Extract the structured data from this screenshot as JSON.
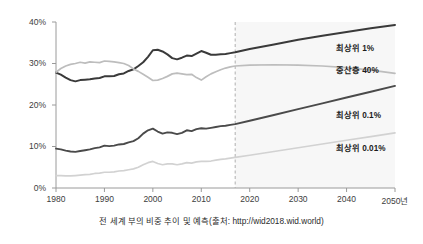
{
  "chart_data": {
    "type": "line",
    "title": "",
    "caption": "전 세계 부의 비중 추이 및 예측(출처: http://wid2018.wid.world)",
    "xlabel": "",
    "ylabel": "",
    "xlim": [
      1980,
      2050
    ],
    "ylim": [
      0,
      40
    ],
    "grid": false,
    "legend_position": "right-inline",
    "forecast_start": 2017,
    "forecast_divider_label": "",
    "y_ticks": [
      0,
      10,
      20,
      30,
      40
    ],
    "y_tick_labels": [
      "0%",
      "10%",
      "20%",
      "30%",
      "40%"
    ],
    "x_ticks": [
      1980,
      1990,
      2000,
      2010,
      2020,
      2030,
      2040,
      2050
    ],
    "x_tick_labels": [
      "1980",
      "1990",
      "2000",
      "2010",
      "2020",
      "2030",
      "2040",
      "2050년"
    ],
    "series": [
      {
        "name": "최상위 1%",
        "label": "최상위 1%",
        "color": "#3a3a3a",
        "width": 2.0,
        "x": [
          1980,
          1981,
          1982,
          1983,
          1984,
          1985,
          1986,
          1987,
          1988,
          1989,
          1990,
          1991,
          1992,
          1993,
          1994,
          1995,
          1996,
          1997,
          1998,
          1999,
          2000,
          2001,
          2002,
          2003,
          2004,
          2005,
          2006,
          2007,
          2008,
          2009,
          2010,
          2011,
          2012,
          2013,
          2014,
          2015,
          2016,
          2017,
          2020,
          2025,
          2030,
          2035,
          2040,
          2045,
          2050
        ],
        "values": [
          27.8,
          27.3,
          26.6,
          26.0,
          25.7,
          26.0,
          26.1,
          26.2,
          26.4,
          26.5,
          26.9,
          26.9,
          27.0,
          27.4,
          27.6,
          28.2,
          28.6,
          29.4,
          30.3,
          31.6,
          33.2,
          33.3,
          32.9,
          32.2,
          31.3,
          31.0,
          31.4,
          31.9,
          31.8,
          32.4,
          33.0,
          32.6,
          32.1,
          32.1,
          32.2,
          32.3,
          32.5,
          32.7,
          33.5,
          34.6,
          35.7,
          36.7,
          37.6,
          38.5,
          39.3
        ]
      },
      {
        "name": "중산층 40%",
        "label": "중산층 40%",
        "color": "#bdbdbd",
        "width": 1.7,
        "x": [
          1980,
          1981,
          1982,
          1983,
          1984,
          1985,
          1986,
          1987,
          1988,
          1989,
          1990,
          1991,
          1992,
          1993,
          1994,
          1995,
          1996,
          1997,
          1998,
          1999,
          2000,
          2001,
          2002,
          2003,
          2004,
          2005,
          2006,
          2007,
          2008,
          2009,
          2010,
          2011,
          2012,
          2013,
          2014,
          2015,
          2016,
          2017,
          2020,
          2025,
          2030,
          2035,
          2040,
          2045,
          2050
        ],
        "values": [
          27.9,
          28.8,
          29.4,
          29.8,
          30.0,
          30.3,
          30.1,
          30.4,
          30.3,
          30.2,
          30.6,
          30.5,
          30.4,
          30.2,
          30.0,
          29.5,
          28.7,
          28.1,
          27.4,
          26.7,
          25.9,
          26.0,
          26.4,
          26.9,
          27.5,
          27.7,
          27.5,
          27.3,
          27.4,
          26.6,
          26.0,
          26.8,
          27.5,
          28.0,
          28.5,
          28.9,
          29.2,
          29.4,
          29.6,
          29.7,
          29.6,
          29.4,
          29.0,
          28.4,
          27.6
        ]
      },
      {
        "name": "최상위 0.1%",
        "label": "최상위 0.1%",
        "color": "#4a4a4a",
        "width": 1.9,
        "x": [
          1980,
          1981,
          1982,
          1983,
          1984,
          1985,
          1986,
          1987,
          1988,
          1989,
          1990,
          1991,
          1992,
          1993,
          1994,
          1995,
          1996,
          1997,
          1998,
          1999,
          2000,
          2001,
          2002,
          2003,
          2004,
          2005,
          2006,
          2007,
          2008,
          2009,
          2010,
          2011,
          2012,
          2013,
          2014,
          2015,
          2016,
          2017,
          2020,
          2025,
          2030,
          2035,
          2040,
          2045,
          2050
        ],
        "values": [
          9.5,
          9.3,
          9.0,
          8.8,
          8.7,
          8.9,
          9.1,
          9.3,
          9.6,
          9.8,
          10.2,
          10.1,
          10.2,
          10.5,
          10.6,
          11.0,
          11.3,
          12.0,
          13.1,
          13.9,
          14.3,
          13.6,
          13.1,
          13.4,
          13.3,
          13.0,
          13.3,
          13.9,
          13.7,
          14.2,
          14.4,
          14.3,
          14.5,
          14.7,
          14.9,
          15.0,
          15.2,
          15.4,
          16.2,
          17.6,
          19.0,
          20.4,
          21.8,
          23.2,
          24.6
        ]
      },
      {
        "name": "최상위 0.01%",
        "label": "최상위 0.01%",
        "color": "#d2d2d2",
        "width": 1.7,
        "x": [
          1980,
          1981,
          1982,
          1983,
          1984,
          1985,
          1986,
          1987,
          1988,
          1989,
          1990,
          1991,
          1992,
          1993,
          1994,
          1995,
          1996,
          1997,
          1998,
          1999,
          2000,
          2001,
          2002,
          2003,
          2004,
          2005,
          2006,
          2007,
          2008,
          2009,
          2010,
          2011,
          2012,
          2013,
          2014,
          2015,
          2016,
          2017,
          2020,
          2025,
          2030,
          2035,
          2040,
          2045,
          2050
        ],
        "values": [
          3.0,
          3.0,
          2.9,
          2.9,
          3.0,
          3.1,
          3.2,
          3.3,
          3.5,
          3.6,
          3.8,
          3.8,
          3.9,
          4.1,
          4.2,
          4.4,
          4.6,
          5.0,
          5.6,
          6.1,
          6.4,
          5.9,
          5.6,
          5.8,
          5.8,
          5.6,
          5.8,
          6.1,
          6.0,
          6.3,
          6.4,
          6.4,
          6.5,
          6.7,
          6.9,
          7.0,
          7.2,
          7.4,
          7.9,
          8.8,
          9.7,
          10.6,
          11.5,
          12.4,
          13.3
        ]
      }
    ],
    "series_label_positions": [
      {
        "label": "최상위 1%",
        "y_pct": 34.2
      },
      {
        "label": "중산층 40%",
        "y_pct": 28.9
      },
      {
        "label": "최상위 0.1%",
        "y_pct": 18.0
      },
      {
        "label": "최상위 0.01%",
        "y_pct": 10.2
      }
    ]
  },
  "colors": {
    "axis": "#9a9a9a",
    "text": "#3d3d3d",
    "forecast_divider": "#b0b0b0",
    "forecast_band": "#f4f4f4",
    "background": "#ffffff"
  }
}
